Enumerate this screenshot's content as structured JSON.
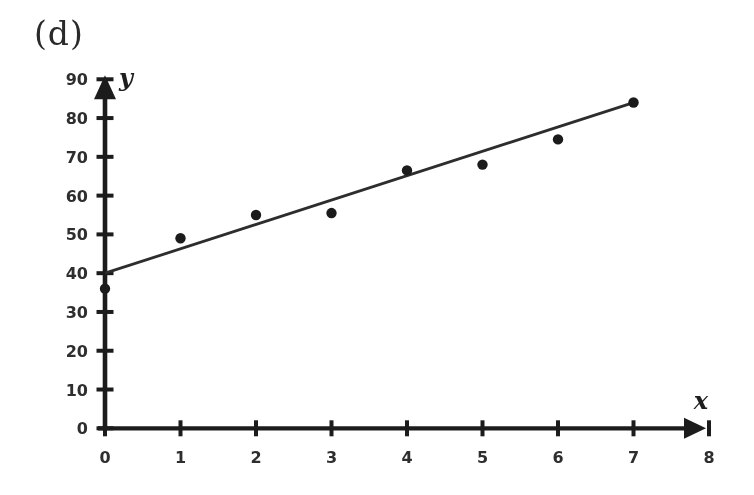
{
  "page": {
    "panel_label": "(d)",
    "background_color": "#ffffff"
  },
  "chart_data": {
    "type": "scatter",
    "title": "",
    "xlabel": "x",
    "ylabel": "y",
    "points": [
      {
        "x": 0,
        "y": 36
      },
      {
        "x": 1,
        "y": 49
      },
      {
        "x": 2,
        "y": 55
      },
      {
        "x": 3,
        "y": 55.5
      },
      {
        "x": 4,
        "y": 66.5
      },
      {
        "x": 5,
        "y": 68
      },
      {
        "x": 6,
        "y": 74.5
      },
      {
        "x": 7,
        "y": 84
      }
    ],
    "trend_line": {
      "x1": 0,
      "y1": 40,
      "x2": 7,
      "y2": 84
    },
    "xlim": [
      0,
      8
    ],
    "ylim": [
      0,
      90
    ],
    "x_ticks": [
      0,
      1,
      2,
      3,
      4,
      5,
      6,
      7,
      8
    ],
    "y_ticks": [
      0,
      10,
      20,
      30,
      40,
      50,
      60,
      70,
      80,
      90
    ],
    "grid": false,
    "legend": null,
    "marker_color": "#1b1b1b",
    "line_color": "#2d2d2d",
    "axis_color": "#1c1c1c",
    "tick_label_color": "#2e2e2e"
  }
}
